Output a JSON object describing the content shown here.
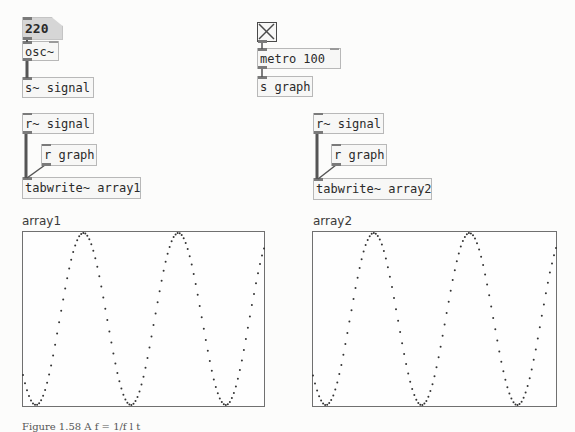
{
  "patch": {
    "left": {
      "number_box": {
        "value": "220"
      },
      "osc": {
        "label": "osc~"
      },
      "send_signal": {
        "label": "s~ signal"
      },
      "receive_signal": {
        "label": "r~ signal"
      },
      "receive_graph": {
        "label": "r graph"
      },
      "tabwrite": {
        "label": "tabwrite~ array1"
      }
    },
    "right": {
      "toggle": {
        "state": "on"
      },
      "metro": {
        "label": "metro 100"
      },
      "send_graph": {
        "label": "s graph"
      },
      "receive_signal": {
        "label": "r~ signal"
      },
      "receive_graph": {
        "label": "r graph"
      },
      "tabwrite": {
        "label": "tabwrite~ array2"
      }
    }
  },
  "arrays": [
    {
      "name": "array1",
      "cycles": 2.5,
      "start_phase": "rising-from-trough"
    },
    {
      "name": "array2",
      "cycles": 2.5,
      "start_phase": "rising-from-trough"
    }
  ],
  "caption": {
    "text": "Figure 1.58   A f = 1/f  l  t"
  },
  "colors": {
    "background": "#fcfcfb",
    "object_border": "#b8b8b8",
    "number_box_fill": "#d6d6d6",
    "wire": "#555555",
    "plot_dots": "#333333"
  }
}
